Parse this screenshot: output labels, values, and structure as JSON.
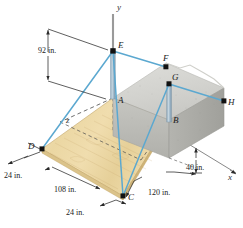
{
  "figure": {
    "type": "engineering-statics-3d-diagram",
    "colors": {
      "cable": "#5BA8D0",
      "post": "#9FB8C8",
      "concrete_top": "#D6D6D2",
      "concrete_front": "#BFBFBB",
      "concrete_side": "#A9A9A4",
      "wood": "#EDD9A8",
      "wood_edge": "#C9AE72",
      "axis": "#8C8C8C",
      "dimension": "#2A2A2A",
      "point": "#111111"
    },
    "points": [
      {
        "id": "A",
        "label": "A",
        "x": 113,
        "y": 98,
        "labeled": true,
        "dot": false
      },
      {
        "id": "B",
        "label": "B",
        "x": 169,
        "y": 120,
        "labeled": true,
        "dot": false
      },
      {
        "id": "C",
        "label": "C",
        "x": 123,
        "y": 196,
        "labeled": true,
        "dot": true
      },
      {
        "id": "D",
        "label": "D",
        "x": 42,
        "y": 149,
        "labeled": true,
        "dot": true
      },
      {
        "id": "E",
        "label": "E",
        "x": 113,
        "y": 51,
        "labeled": true,
        "dot": true
      },
      {
        "id": "F",
        "label": "F",
        "x": 166,
        "y": 67,
        "labeled": true,
        "dot": true
      },
      {
        "id": "G",
        "label": "G",
        "x": 169,
        "y": 84,
        "labeled": true,
        "dot": true
      },
      {
        "id": "H",
        "label": "H",
        "x": 224,
        "y": 101,
        "labeled": true,
        "dot": true
      }
    ],
    "cables": [
      {
        "from": "E",
        "to": "F"
      },
      {
        "from": "E",
        "to": "D"
      },
      {
        "from": "E",
        "to": "C"
      },
      {
        "from": "G",
        "to": "H"
      },
      {
        "from": "G",
        "to": "C"
      }
    ],
    "posts": [
      {
        "top": "E",
        "bottom": "A"
      },
      {
        "top": "G",
        "bottom": "B"
      }
    ],
    "axes": [
      {
        "id": "y",
        "label": "y"
      },
      {
        "id": "x",
        "label": "x"
      },
      {
        "id": "z",
        "label": "z"
      }
    ],
    "dimensions": [
      {
        "id": "post-height",
        "value": "92 in.",
        "x": 38,
        "y": 47
      },
      {
        "id": "plank-offset-left",
        "value": "24 in.",
        "x": 4,
        "y": 172
      },
      {
        "id": "plank-length",
        "value": "108 in.",
        "x": 54,
        "y": 186
      },
      {
        "id": "plank-offset-bottom",
        "value": "24 in.",
        "x": 66,
        "y": 209
      },
      {
        "id": "block-height",
        "value": "40 in.",
        "x": 186,
        "y": 164
      },
      {
        "id": "block-length",
        "value": "120 in.",
        "x": 148,
        "y": 189
      }
    ]
  }
}
